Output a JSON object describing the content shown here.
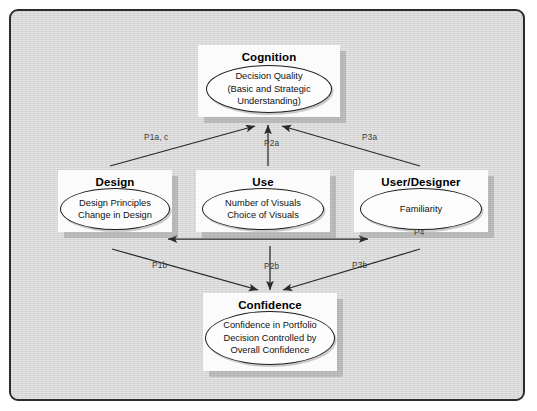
{
  "diagram": {
    "title_present": false,
    "frame": {
      "border_color": "#2b2b2b",
      "background_color": "#d6d6d6"
    },
    "nodes": [
      {
        "id": "cognition",
        "title": "Cognition",
        "ellipse_text": "Decision Quality\n(Basic and Strategic\nUnderstanding)"
      },
      {
        "id": "design",
        "title": "Design",
        "ellipse_text": "Design Principles\nChange in Design"
      },
      {
        "id": "use",
        "title": "Use",
        "ellipse_text": "Number of Visuals\nChoice of Visuals"
      },
      {
        "id": "userdesigner",
        "title": "User/Designer",
        "ellipse_text": "Familiarity"
      },
      {
        "id": "confidence",
        "title": "Confidence",
        "ellipse_text": "Confidence in Portfolio\nDecision Controlled by\nOverall Confidence"
      }
    ],
    "edges": [
      {
        "id": "p1ac",
        "label": "P1a, c",
        "from": "design",
        "to": "cognition",
        "arrow": "single"
      },
      {
        "id": "p2a",
        "label": "P2a",
        "from": "use",
        "to": "cognition",
        "arrow": "single"
      },
      {
        "id": "p3a",
        "label": "P3a",
        "from": "userdesigner",
        "to": "cognition",
        "arrow": "single"
      },
      {
        "id": "p1b",
        "label": "P1b",
        "from": "design",
        "to": "confidence",
        "arrow": "single"
      },
      {
        "id": "p2b",
        "label": "P2b",
        "from": "use",
        "to": "confidence",
        "arrow": "single"
      },
      {
        "id": "p3b",
        "label": "P3b",
        "from": "userdesigner",
        "to": "confidence",
        "arrow": "single"
      },
      {
        "id": "p4",
        "label": "P4",
        "from": "use",
        "to": "userdesigner",
        "arrow": "double"
      }
    ]
  }
}
